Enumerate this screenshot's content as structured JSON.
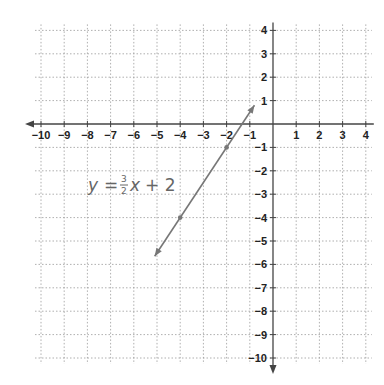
{
  "chart_data": {
    "type": "line",
    "title": "",
    "xlabel": "",
    "ylabel": "",
    "xlim": [
      -10,
      4
    ],
    "ylim": [
      -10,
      4
    ],
    "grid": true,
    "x_ticks": [
      -10,
      -9,
      -8,
      -7,
      -6,
      -5,
      -4,
      -3,
      -2,
      -1,
      1,
      2,
      3,
      4
    ],
    "y_ticks": [
      4,
      3,
      2,
      1,
      -1,
      -2,
      -3,
      -4,
      -5,
      -6,
      -7,
      -8,
      -9,
      -10
    ],
    "series": [
      {
        "name": "y = 3/2 x + 2",
        "slope": 1.5,
        "intercept": 2,
        "marked_points": [
          [
            -4,
            -4
          ],
          [
            -2,
            -1
          ]
        ],
        "segment": {
          "from": [
            -5.1,
            -5.65
          ],
          "to": [
            -0.8,
            0.8
          ]
        },
        "color": "#777777"
      }
    ],
    "annotations": [
      {
        "text": "y = 3/2 x + 2",
        "x": -7.8,
        "y": -3.2
      }
    ]
  },
  "equation": {
    "y": "y",
    "equals": "=",
    "num": "3",
    "den": "2",
    "x": "x",
    "plus": "+ 2"
  },
  "colors": {
    "grid": "#9a9a9a",
    "axis": "#444444",
    "line": "#777777",
    "text": "#222222"
  }
}
